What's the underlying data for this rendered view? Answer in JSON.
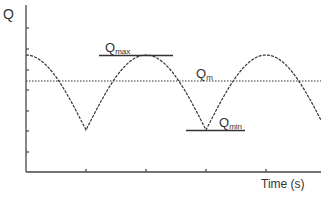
{
  "diagram": {
    "y_axis_label": "Q",
    "x_axis_label": "Time (s)",
    "labels": {
      "qmax": {
        "base": "Q",
        "sub": "max"
      },
      "qm": {
        "base": "Q",
        "sub": "m"
      },
      "qmin": {
        "base": "Q",
        "sub": "min"
      }
    },
    "colors": {
      "line": "#333333",
      "axis": "#444444"
    }
  },
  "chart_data": {
    "type": "line",
    "title": "",
    "xlabel": "Time (s)",
    "ylabel": "Q",
    "series": [
      {
        "name": "Q(t)",
        "style": "dashed",
        "shape": "abs-cosine",
        "peaks_at_tick": [
          0,
          2,
          4
        ],
        "minima_at_tick": [
          1,
          3
        ]
      }
    ],
    "reference_lines": [
      {
        "name": "Qmax",
        "style": "solid",
        "relative_level": 1.0
      },
      {
        "name": "Qm",
        "style": "dotted",
        "relative_level": 0.65
      },
      {
        "name": "Qmin",
        "style": "solid",
        "relative_level": 0.0
      }
    ],
    "x_ticks": 4,
    "y_ticks": 7,
    "grid": false
  }
}
